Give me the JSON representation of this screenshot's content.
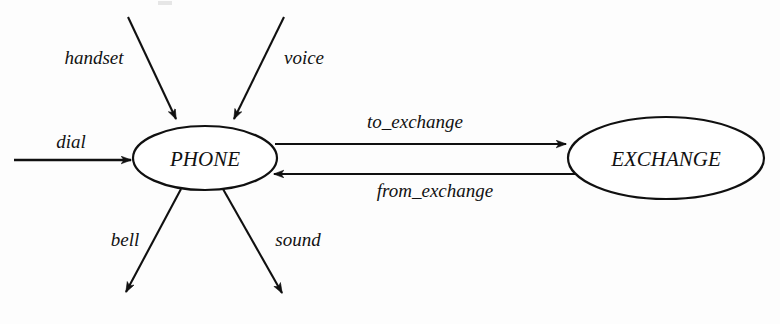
{
  "diagram": {
    "type": "data-flow-context-diagram",
    "background_color": "#fdfdfd",
    "ink_color": "#101010",
    "nodes": [
      {
        "id": "phone",
        "label": "PHONE",
        "shape": "ellipse",
        "cx": 205,
        "cy": 158,
        "rx": 72,
        "ry": 32,
        "font_size": 21
      },
      {
        "id": "exchange",
        "label": "EXCHANGE",
        "shape": "ellipse",
        "cx": 666,
        "cy": 158,
        "rx": 98,
        "ry": 41,
        "font_size": 21
      }
    ],
    "flows": [
      {
        "id": "handset",
        "label": "handset",
        "direction": "in",
        "from": "external",
        "to": "phone",
        "label_x": 94,
        "label_y": 64,
        "font_size": 19,
        "line": {
          "x1": 128,
          "y1": 17,
          "x2": 177,
          "y2": 121
        }
      },
      {
        "id": "voice",
        "label": "voice",
        "direction": "in",
        "from": "external",
        "to": "phone",
        "label_x": 304,
        "label_y": 64,
        "font_size": 19,
        "line": {
          "x1": 284,
          "y1": 17,
          "x2": 233,
          "y2": 121
        }
      },
      {
        "id": "dial",
        "label": "dial",
        "direction": "in",
        "from": "external",
        "to": "phone",
        "label_x": 71,
        "label_y": 148,
        "font_size": 19,
        "line": {
          "x1": 14,
          "y1": 160,
          "x2": 133,
          "y2": 160
        }
      },
      {
        "id": "bell",
        "label": "bell",
        "direction": "out",
        "from": "phone",
        "to": "external",
        "label_x": 125,
        "label_y": 246,
        "font_size": 19,
        "line": {
          "x1": 181,
          "y1": 189,
          "x2": 124,
          "y2": 296
        }
      },
      {
        "id": "sound",
        "label": "sound",
        "direction": "out",
        "from": "phone",
        "to": "external",
        "label_x": 298,
        "label_y": 246,
        "font_size": 19,
        "line": {
          "x1": 223,
          "y1": 189,
          "x2": 284,
          "y2": 297
        }
      },
      {
        "id": "to_exchange",
        "label": "to_exchange",
        "direction": "out",
        "from": "phone",
        "to": "exchange",
        "label_x": 415,
        "label_y": 128,
        "font_size": 19,
        "line": {
          "x1": 275,
          "y1": 144,
          "x2": 568,
          "y2": 144
        }
      },
      {
        "id": "from_exchange",
        "label": "from_exchange",
        "direction": "in",
        "from": "exchange",
        "to": "phone",
        "label_x": 435,
        "label_y": 197,
        "font_size": 19,
        "line": {
          "x1": 590,
          "y1": 174,
          "x2": 272,
          "y2": 174
        }
      }
    ]
  }
}
